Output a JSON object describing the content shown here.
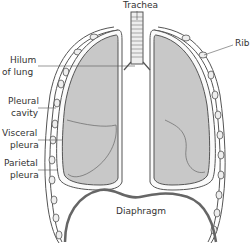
{
  "labels": {
    "trachea": "Trachea",
    "rib": "Rib",
    "hilum_line1": "Hilum",
    "hilum_line2": "of lung",
    "pleural_cavity_line1": "Pleural",
    "pleural_cavity_line2": "cavity",
    "visceral_line1": "Visceral",
    "visceral_line2": "pleura",
    "parietal_line1": "Parietal",
    "parietal_line2": "pleura",
    "diaphragm": "Diaphragm"
  },
  "colors": {
    "lung_fill": "#c8c8c8",
    "outline": "#555555",
    "diaphragm": "#666666",
    "text": "#333333",
    "background": "#ffffff"
  }
}
